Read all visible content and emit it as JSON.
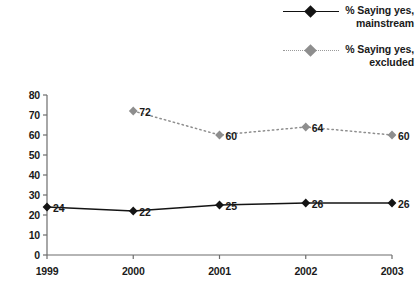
{
  "chart_data": {
    "type": "line",
    "title": "",
    "xlabel": "",
    "ylabel": "",
    "categories": [
      "1999",
      "2000",
      "2001",
      "2002",
      "2003"
    ],
    "ylim": [
      0,
      80
    ],
    "yticks": [
      0,
      10,
      20,
      30,
      40,
      50,
      60,
      70,
      80
    ],
    "grid": false,
    "legend_position": "top-right",
    "series": [
      {
        "name": "% Saying yes, mainstream",
        "label_line1": "% Saying yes,",
        "label_line2": "mainstream",
        "style": "solid",
        "color": "#141414",
        "marker": "diamond",
        "values": [
          24,
          22,
          25,
          26,
          26
        ],
        "point_labels": [
          "24",
          "22",
          "25",
          "26",
          "26"
        ]
      },
      {
        "name": "% Saying yes, excluded",
        "label_line1": "% Saying yes,",
        "label_line2": "excluded",
        "style": "dotted",
        "color": "#8e8e8e",
        "marker": "diamond",
        "values": [
          null,
          72,
          60,
          64,
          60
        ],
        "point_labels": [
          null,
          "72",
          "60",
          "64",
          "60"
        ]
      }
    ]
  },
  "legend": {
    "entries": [
      {
        "line1": "% Saying yes,",
        "line2": "mainstream"
      },
      {
        "line1": "% Saying yes,",
        "line2": "excluded"
      }
    ]
  },
  "axis": {
    "y_labels": [
      "80",
      "70",
      "60",
      "50",
      "40",
      "30",
      "20",
      "10",
      "0"
    ],
    "x_labels": [
      "1999",
      "2000",
      "2001",
      "2002",
      "2003"
    ]
  },
  "colors": {
    "mainstream": "#141414",
    "excluded": "#8e8e8e",
    "axis": "#6d6d6d",
    "text": "#1a1a1a"
  }
}
